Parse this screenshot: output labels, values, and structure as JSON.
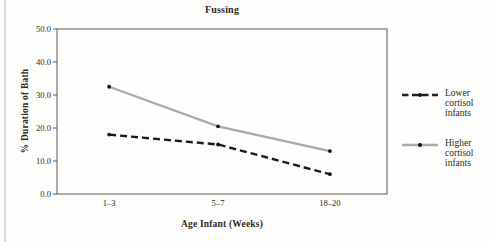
{
  "figure": {
    "background": "#fdfdfb",
    "text_color": "#2e2a26",
    "frame_color": "#5a5a5a",
    "edge_line_color": "#c9c9c6"
  },
  "chart_data": {
    "type": "line",
    "title": "Fussing",
    "xlabel": "Age Infant (Weeks)",
    "ylabel": "% Duration of Bath",
    "categories": [
      "1–3",
      "5–7",
      "18–20"
    ],
    "ylim": [
      0,
      50
    ],
    "yticks": [
      0,
      10,
      20,
      30,
      40,
      50
    ],
    "ytick_labels": [
      "0.0",
      "10.0",
      "20.0",
      "30.0",
      "40.0",
      "50.0"
    ],
    "grid": false,
    "legend_position": "right",
    "series": [
      {
        "name": "Lower cortisol infants",
        "values": [
          18,
          15,
          6
        ],
        "line_style": "dashed",
        "dash": "7 4",
        "color": "#1c1c1c",
        "width": 2.4,
        "marker": "dot",
        "marker_color": "#111111"
      },
      {
        "name": "Higher cortisol infants",
        "values": [
          32.5,
          20.5,
          13
        ],
        "line_style": "solid",
        "dash": "",
        "color": "#a9a9a9",
        "width": 2.2,
        "marker": "dot",
        "marker_color": "#111111"
      }
    ]
  }
}
